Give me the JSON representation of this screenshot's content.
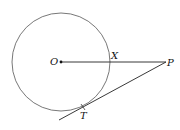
{
  "diagram": {
    "title": "",
    "circle": {
      "cx": 61,
      "cy": 62,
      "r": 49,
      "stroke": "#555555"
    },
    "points": {
      "O": {
        "label": "O",
        "x": 61,
        "y": 62
      },
      "X": {
        "label": "X",
        "x": 110,
        "y": 62
      },
      "P": {
        "label": "P",
        "x": 166,
        "y": 62
      },
      "T": {
        "label": "T",
        "x": 83,
        "y": 107
      }
    },
    "segments": [
      {
        "name": "OP",
        "from": "O",
        "to": "P"
      },
      {
        "name": "tangent-PT",
        "from": "P",
        "to_extended": [
          59,
          120
        ]
      }
    ],
    "line_color": "#222222"
  }
}
